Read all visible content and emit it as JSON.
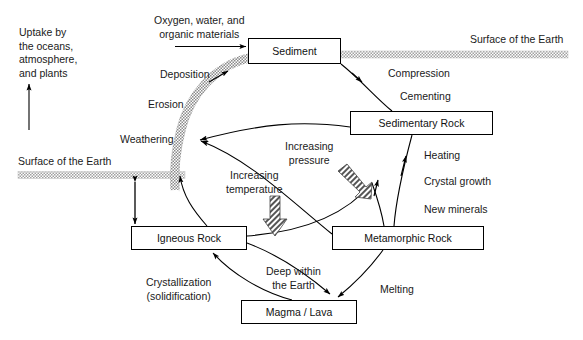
{
  "diagram": {
    "background_color": "#ffffff",
    "line_color": "#000000",
    "band_color": "#b4b4b4",
    "boxes": [
      {
        "id": "sediment",
        "label": "Sediment"
      },
      {
        "id": "sedimentary_rock",
        "label": "Sedimentary Rock"
      },
      {
        "id": "igneous_rock",
        "label": "Igneous Rock"
      },
      {
        "id": "metamorphic_rock",
        "label": "Metamorphic Rock"
      },
      {
        "id": "magma_lava",
        "label": "Magma / Lava"
      }
    ],
    "labels": [
      {
        "id": "uptake",
        "text": "Uptake by\nthe oceans,\natmosphere,\nand plants"
      },
      {
        "id": "oxygen_water",
        "text": "Oxygen, water, and\norganic materials"
      },
      {
        "id": "surface_left",
        "text": "Surface of the Earth"
      },
      {
        "id": "surface_right",
        "text": "Surface of the Earth"
      },
      {
        "id": "deposition",
        "text": "Deposition"
      },
      {
        "id": "erosion",
        "text": "Erosion"
      },
      {
        "id": "weathering",
        "text": "Weathering"
      },
      {
        "id": "compression",
        "text": "Compression"
      },
      {
        "id": "cementing",
        "text": "Cementing"
      },
      {
        "id": "heating",
        "text": "Heating"
      },
      {
        "id": "crystal_growth",
        "text": "Crystal growth"
      },
      {
        "id": "new_minerals",
        "text": "New minerals"
      },
      {
        "id": "increasing_pressure",
        "text": "Increasing\npressure"
      },
      {
        "id": "increasing_temperature",
        "text": "Increasing\ntemperature"
      },
      {
        "id": "deep_within_earth",
        "text": "Deep within\nthe Earth"
      },
      {
        "id": "melting",
        "text": "Melting"
      },
      {
        "id": "crystallization",
        "text": "Crystallization\n(solidification)"
      }
    ]
  }
}
